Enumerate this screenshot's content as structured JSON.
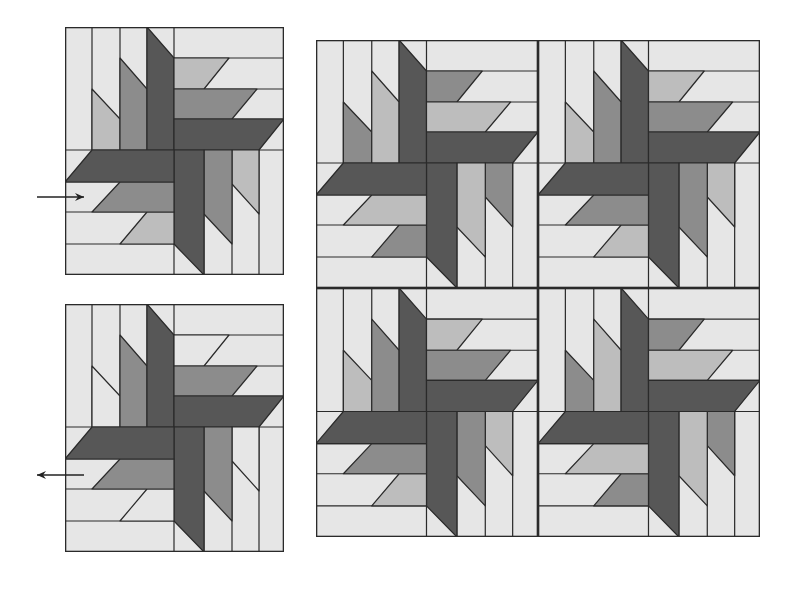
{
  "diagram": {
    "colors": {
      "background": "#e6e6e6",
      "dark": "#575757",
      "medium": "#8c8c8c",
      "light_accent": "#bdbdbd",
      "line": "#2a2a2a"
    },
    "block_geometry": {
      "width": 219,
      "height": 248,
      "cols": [
        0,
        27,
        55,
        82,
        109,
        139,
        167,
        194,
        219
      ],
      "rows": [
        0,
        31,
        62,
        92,
        123,
        155,
        185,
        217,
        248
      ]
    },
    "blocks": [
      {
        "id": "sample-block-a",
        "x": 65,
        "y": 27,
        "w": 219,
        "h": 248,
        "variant": "standard"
      },
      {
        "id": "sample-block-b",
        "x": 65,
        "y": 304,
        "w": 219,
        "h": 248,
        "variant": "no-accent"
      },
      {
        "id": "grid-top-left",
        "x": 316,
        "y": 40,
        "w": 222,
        "h": 248,
        "variant": "swapped"
      },
      {
        "id": "grid-top-right",
        "x": 538,
        "y": 40,
        "w": 222,
        "h": 248,
        "variant": "standard"
      },
      {
        "id": "grid-bottom-left",
        "x": 316,
        "y": 288,
        "w": 222,
        "h": 249,
        "variant": "standard"
      },
      {
        "id": "grid-bottom-right",
        "x": 538,
        "y": 288,
        "w": 222,
        "h": 249,
        "variant": "swapped"
      }
    ],
    "arrows": [
      {
        "id": "arrow-right",
        "direction": "right",
        "x1": 37,
        "x2": 84,
        "y": 197
      },
      {
        "id": "arrow-left",
        "direction": "left",
        "x1": 84,
        "x2": 37,
        "y": 475
      }
    ]
  }
}
